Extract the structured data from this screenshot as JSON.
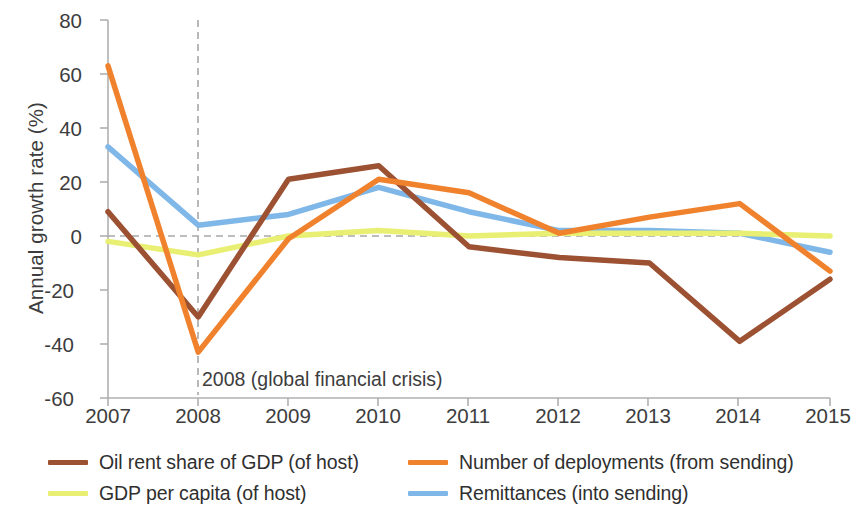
{
  "chart_data": {
    "type": "line",
    "title": "",
    "xlabel": "",
    "ylabel": "Annual growth rate (%)",
    "x": [
      2007,
      2008,
      2009,
      2010,
      2011,
      2012,
      2013,
      2014,
      2015
    ],
    "xticklabels": [
      "2007",
      "2008",
      "2009",
      "2010",
      "2011",
      "2012",
      "2013",
      "2014",
      "2015"
    ],
    "yticklabels": [
      "80",
      "60",
      "40",
      "20",
      "0",
      "-20",
      "-40",
      "-60"
    ],
    "yticks": [
      80,
      60,
      40,
      20,
      0,
      -20,
      -40,
      -60
    ],
    "ylim": [
      -60,
      80
    ],
    "xlim": [
      2007,
      2015
    ],
    "grid": false,
    "zero_line": true,
    "legend_position": "below",
    "annotations": [
      {
        "text": "2008 (global financial crisis)",
        "x": 2008,
        "type": "vertical-dashed-line-with-label"
      }
    ],
    "series": [
      {
        "name": "Oil rent share of GDP (of host)",
        "color": "#9c5132",
        "values": [
          9,
          -30,
          21,
          26,
          -4,
          -8,
          -10,
          -39,
          -16
        ]
      },
      {
        "name": "Number of deployments (from sending)",
        "color": "#f0822e",
        "values": [
          63,
          -43,
          -1,
          21,
          16,
          1,
          7,
          12,
          -13
        ]
      },
      {
        "name": "GDP per capita (of host)",
        "color": "#e8ef72",
        "values": [
          -2,
          -7,
          0,
          2,
          0,
          1,
          1,
          1,
          0
        ]
      },
      {
        "name": "Remittances (into sending)",
        "color": "#7fb8e8",
        "values": [
          33,
          4,
          8,
          18,
          9,
          2,
          2,
          1,
          -6
        ]
      }
    ]
  },
  "legend": {
    "items": [
      {
        "label": "Oil rent share of GDP (of host)",
        "color": "#9c5132"
      },
      {
        "label": "Number of deployments (from sending)",
        "color": "#f0822e"
      },
      {
        "label": "GDP per capita (of host)",
        "color": "#e8ef72"
      },
      {
        "label": "Remittances (into sending)",
        "color": "#7fb8e8"
      }
    ]
  },
  "axis": {
    "y_title": "Annual growth rate (%)"
  }
}
